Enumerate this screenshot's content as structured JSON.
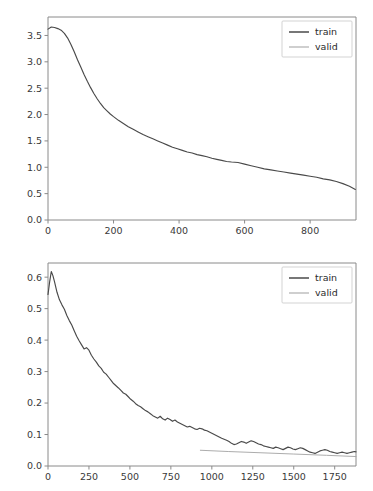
{
  "figure": {
    "background_color": "#ffffff",
    "width": 373,
    "height": 491,
    "subplot_count": 2
  },
  "colors": {
    "train": "#4a4a4a",
    "valid": "#a8a8a8",
    "axis": "#8a8a8a",
    "text": "#3a3a3a",
    "legend_border": "#c8c8c8"
  },
  "chart_data": [
    {
      "type": "line",
      "title": "",
      "xlabel": "",
      "ylabel": "",
      "xlim": [
        0,
        940
      ],
      "ylim": [
        0.0,
        3.85
      ],
      "grid": false,
      "legend_position": "upper right",
      "xticks": [
        0,
        200,
        400,
        600,
        800
      ],
      "xticklabels": [
        "0",
        "200",
        "400",
        "600",
        "800"
      ],
      "yticks": [
        0.0,
        0.5,
        1.0,
        1.5,
        2.0,
        2.5,
        3.0,
        3.5
      ],
      "yticklabels": [
        "0.0",
        "0.5",
        "1.0",
        "1.5",
        "2.0",
        "2.5",
        "3.0",
        "3.5"
      ],
      "series": [
        {
          "name": "train",
          "color": "#4a4a4a",
          "x": [
            0,
            10,
            20,
            30,
            40,
            50,
            60,
            70,
            80,
            90,
            100,
            110,
            120,
            130,
            140,
            150,
            160,
            170,
            180,
            190,
            200,
            215,
            230,
            245,
            260,
            275,
            290,
            305,
            320,
            335,
            350,
            365,
            380,
            395,
            410,
            425,
            440,
            455,
            470,
            485,
            500,
            515,
            530,
            545,
            560,
            580,
            600,
            620,
            640,
            660,
            680,
            700,
            720,
            740,
            760,
            780,
            800,
            820,
            840,
            860,
            880,
            900,
            920,
            938
          ],
          "values": [
            3.62,
            3.66,
            3.65,
            3.63,
            3.6,
            3.54,
            3.45,
            3.33,
            3.19,
            3.04,
            2.9,
            2.76,
            2.63,
            2.51,
            2.4,
            2.3,
            2.21,
            2.13,
            2.07,
            2.01,
            1.96,
            1.89,
            1.83,
            1.77,
            1.72,
            1.67,
            1.62,
            1.58,
            1.54,
            1.5,
            1.46,
            1.42,
            1.38,
            1.35,
            1.32,
            1.29,
            1.27,
            1.24,
            1.22,
            1.2,
            1.17,
            1.15,
            1.13,
            1.11,
            1.1,
            1.09,
            1.06,
            1.03,
            1.0,
            0.97,
            0.95,
            0.93,
            0.91,
            0.89,
            0.87,
            0.85,
            0.83,
            0.81,
            0.78,
            0.76,
            0.73,
            0.69,
            0.64,
            0.58
          ]
        },
        {
          "name": "valid",
          "color": "#a8a8a8",
          "x": [],
          "values": []
        }
      ],
      "legend": [
        "train",
        "valid"
      ]
    },
    {
      "type": "line",
      "title": "",
      "xlabel": "",
      "ylabel": "",
      "xlim": [
        0,
        1880
      ],
      "ylim": [
        0.0,
        0.645
      ],
      "grid": false,
      "legend_position": "upper right",
      "xticks": [
        0,
        250,
        500,
        750,
        1000,
        1250,
        1500,
        1750
      ],
      "xticklabels": [
        "0",
        "250",
        "500",
        "750",
        "1000",
        "1250",
        "1500",
        "1750"
      ],
      "yticks": [
        0.0,
        0.1,
        0.2,
        0.3,
        0.4,
        0.5,
        0.6
      ],
      "yticklabels": [
        "0.0",
        "0.1",
        "0.2",
        "0.3",
        "0.4",
        "0.5",
        "0.6"
      ],
      "series": [
        {
          "name": "train",
          "color": "#4a4a4a",
          "x": [
            0,
            10,
            20,
            30,
            40,
            55,
            70,
            85,
            100,
            115,
            130,
            145,
            160,
            175,
            190,
            205,
            220,
            235,
            250,
            265,
            280,
            295,
            310,
            325,
            340,
            355,
            370,
            385,
            400,
            415,
            430,
            445,
            460,
            475,
            490,
            505,
            520,
            535,
            550,
            565,
            580,
            595,
            610,
            625,
            640,
            655,
            670,
            685,
            700,
            715,
            730,
            745,
            760,
            775,
            790,
            805,
            820,
            835,
            850,
            865,
            880,
            895,
            910,
            925,
            940,
            955,
            970,
            985,
            1000,
            1015,
            1030,
            1045,
            1060,
            1075,
            1090,
            1105,
            1120,
            1135,
            1150,
            1165,
            1180,
            1195,
            1210,
            1225,
            1240,
            1255,
            1270,
            1285,
            1300,
            1315,
            1330,
            1345,
            1360,
            1375,
            1390,
            1405,
            1420,
            1435,
            1450,
            1465,
            1480,
            1495,
            1510,
            1525,
            1540,
            1555,
            1570,
            1585,
            1600,
            1615,
            1630,
            1645,
            1660,
            1675,
            1690,
            1705,
            1720,
            1735,
            1750,
            1765,
            1780,
            1795,
            1810,
            1825,
            1840,
            1855,
            1870,
            1880
          ],
          "values": [
            0.545,
            0.585,
            0.618,
            0.605,
            0.585,
            0.552,
            0.528,
            0.512,
            0.498,
            0.478,
            0.462,
            0.448,
            0.43,
            0.412,
            0.398,
            0.385,
            0.372,
            0.376,
            0.368,
            0.352,
            0.34,
            0.33,
            0.318,
            0.31,
            0.298,
            0.292,
            0.282,
            0.272,
            0.262,
            0.255,
            0.248,
            0.24,
            0.232,
            0.228,
            0.22,
            0.212,
            0.206,
            0.198,
            0.192,
            0.188,
            0.182,
            0.176,
            0.172,
            0.166,
            0.16,
            0.156,
            0.152,
            0.158,
            0.15,
            0.146,
            0.152,
            0.148,
            0.142,
            0.146,
            0.14,
            0.136,
            0.132,
            0.128,
            0.124,
            0.126,
            0.122,
            0.118,
            0.116,
            0.12,
            0.118,
            0.114,
            0.112,
            0.108,
            0.104,
            0.1,
            0.096,
            0.092,
            0.088,
            0.085,
            0.082,
            0.078,
            0.072,
            0.068,
            0.07,
            0.074,
            0.078,
            0.076,
            0.072,
            0.076,
            0.08,
            0.078,
            0.074,
            0.07,
            0.068,
            0.064,
            0.062,
            0.06,
            0.058,
            0.056,
            0.06,
            0.058,
            0.055,
            0.052,
            0.056,
            0.06,
            0.058,
            0.054,
            0.052,
            0.055,
            0.058,
            0.056,
            0.052,
            0.048,
            0.044,
            0.042,
            0.04,
            0.044,
            0.048,
            0.05,
            0.052,
            0.05,
            0.046,
            0.044,
            0.042,
            0.04,
            0.042,
            0.044,
            0.042,
            0.04,
            0.042,
            0.044,
            0.046,
            0.045,
            0.044,
            0.046
          ]
        },
        {
          "name": "valid",
          "color": "#a8a8a8",
          "x": [
            930,
            1100,
            1300,
            1500,
            1700,
            1880
          ],
          "values": [
            0.05,
            0.046,
            0.042,
            0.038,
            0.034,
            0.03
          ]
        }
      ],
      "legend": [
        "train",
        "valid"
      ]
    }
  ]
}
